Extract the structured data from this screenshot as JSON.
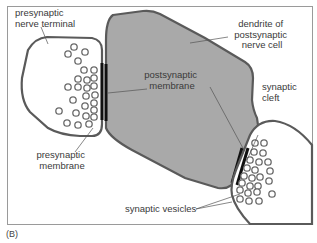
{
  "figure": {
    "panel_label": "(B)",
    "colors": {
      "frame": "#9a9a9a",
      "outline": "#5a5a5a",
      "dendrite_fill": "#a9a9a9",
      "membrane": "#111111",
      "vesicle": "#6a6a6a",
      "text": "#3a3a3a"
    }
  },
  "labels": {
    "presynaptic_terminal": [
      "presynaptic",
      "nerve terminal"
    ],
    "dendrite": [
      "dendrite of",
      "postsynaptic",
      "nerve cell"
    ],
    "postsynaptic_membrane": [
      "postsynaptic",
      "membrane"
    ],
    "synaptic_cleft": [
      "synaptic",
      "cleft"
    ],
    "presynaptic_membrane": [
      "presynaptic",
      "membrane"
    ],
    "synaptic_vesicles": "synaptic vesicles"
  }
}
